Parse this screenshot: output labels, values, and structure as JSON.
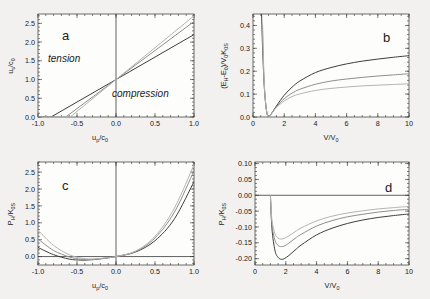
{
  "figure": {
    "background_color": "#f2f1ef",
    "frame_color": "#4a4a4a",
    "panel_fill": "#fdfdfc"
  },
  "curve_colors": [
    "#3d3d3d",
    "#8e8e8e",
    "#b4b4b4"
  ],
  "panels": {
    "a": {
      "letter": "a",
      "xlabel_main": "u",
      "xlabel_sub1": "p",
      "xlabel_mid": "/c",
      "xlabel_sub2": "0",
      "ylabel_main": "u",
      "ylabel_sub1": "s",
      "ylabel_mid": "/c",
      "ylabel_sub2": "0",
      "region_tension": "tension",
      "region_compression": "compression",
      "xticks": [
        "-1.0",
        "-0.5",
        "0.0",
        "0.5",
        "1.0"
      ],
      "yticks": [
        "0.0",
        "0.5",
        "1.0",
        "1.5",
        "2.0",
        "2.5"
      ]
    },
    "b": {
      "letter": "b",
      "xlabel_main": "V/V",
      "xlabel_sub": "0",
      "ylabel_p1": "(E",
      "ylabel_s1": "H",
      "ylabel_p2": "-E",
      "ylabel_s2": "0",
      "ylabel_p3": ")/V",
      "ylabel_s3": "0",
      "ylabel_p4": "K",
      "ylabel_s4": "0S",
      "xticks": [
        "0",
        "2",
        "4",
        "6",
        "8",
        "10"
      ],
      "yticks": [
        "0.0",
        "0.1",
        "0.2",
        "0.3",
        "0.4"
      ]
    },
    "c": {
      "letter": "c",
      "xlabel_main": "u",
      "xlabel_sub1": "p",
      "xlabel_mid": "/c",
      "xlabel_sub2": "0",
      "ylabel_p1": "P",
      "ylabel_s1": "H",
      "ylabel_p2": "/K",
      "ylabel_s2": "0S",
      "xticks": [
        "-1.0",
        "-0.5",
        "0.0",
        "0.5",
        "1.0"
      ],
      "yticks": [
        "0.0",
        "0.5",
        "1.0",
        "1.5",
        "2.0",
        "2.5"
      ]
    },
    "d": {
      "letter": "d",
      "xlabel_main": "V/V",
      "xlabel_sub": "0",
      "ylabel_p1": "P",
      "ylabel_s1": "H",
      "ylabel_p2": "/K",
      "ylabel_s2": "0S",
      "xticks": [
        "0",
        "2",
        "4",
        "6",
        "8",
        "10"
      ],
      "yticks": [
        "0.10",
        "0.05",
        "0.00",
        "-0.05",
        "-0.10",
        "-0.15",
        "-0.20"
      ]
    }
  },
  "chart_data": [
    {
      "id": "a",
      "type": "line",
      "title": "a",
      "xlabel": "u_p/c_0",
      "ylabel": "u_s/c_0",
      "xlim": [
        -1.0,
        1.0
      ],
      "ylim": [
        0.0,
        2.75
      ],
      "grid": false,
      "legend": "none",
      "annotations": [
        "tension",
        "compression"
      ],
      "note": "Shock velocity vs particle velocity; three linear Hugoniots u_s/c_0 = 1 + S*(u_p/c_0) with differing slopes S, all passing through (0,1).",
      "series": [
        {
          "name": "S = 1.20",
          "x": [
            -1.0,
            -0.8333,
            -0.5,
            0.0,
            0.5,
            1.0
          ],
          "y": [
            0.0,
            0.0,
            0.4,
            1.0,
            1.6,
            2.2
          ]
        },
        {
          "name": "S = 1.55",
          "x": [
            -1.0,
            -0.645,
            -0.5,
            0.0,
            0.5,
            1.0
          ],
          "y": [
            0.0,
            0.0,
            0.225,
            1.0,
            1.775,
            2.55
          ]
        },
        {
          "name": "S = 1.70",
          "x": [
            -1.0,
            -0.588,
            -0.5,
            0.0,
            0.5,
            1.0
          ],
          "y": [
            0.0,
            0.0,
            0.15,
            1.0,
            1.85,
            2.7
          ]
        }
      ]
    },
    {
      "id": "b",
      "type": "line",
      "title": "b",
      "xlabel": "V/V_0",
      "ylabel": "(E_H-E_0)/V_0K_0S",
      "xlim": [
        0,
        10
      ],
      "ylim": [
        0.0,
        0.45
      ],
      "grid": false,
      "legend": "none",
      "note": "Hugoniot energy rises steeply for V/V_0 < 1, passes through zero at V/V_0 = 1, then increases monotonically toward a plateau.",
      "series": [
        {
          "name": "S = 1.20",
          "x": [
            0.55,
            0.6,
            0.7,
            0.8,
            0.9,
            1.0,
            1.2,
            1.5,
            2.0,
            2.5,
            3.0,
            4.0,
            5.0,
            6.0,
            7.0,
            8.0,
            9.0,
            10.0
          ],
          "y": [
            0.45,
            0.33,
            0.16,
            0.065,
            0.015,
            0.0,
            0.017,
            0.048,
            0.095,
            0.13,
            0.157,
            0.194,
            0.216,
            0.232,
            0.244,
            0.253,
            0.261,
            0.268
          ]
        },
        {
          "name": "S = 1.55",
          "x": [
            0.6,
            0.7,
            0.8,
            0.9,
            1.0,
            1.2,
            1.5,
            2.0,
            2.5,
            3.0,
            4.0,
            5.0,
            6.0,
            7.0,
            8.0,
            9.0,
            10.0
          ],
          "y": [
            0.4,
            0.175,
            0.068,
            0.016,
            0.0,
            0.016,
            0.044,
            0.08,
            0.104,
            0.121,
            0.143,
            0.157,
            0.166,
            0.173,
            0.179,
            0.184,
            0.189
          ]
        },
        {
          "name": "S = 1.70",
          "x": [
            0.62,
            0.7,
            0.8,
            0.9,
            1.0,
            1.2,
            1.5,
            2.0,
            2.5,
            3.0,
            4.0,
            5.0,
            6.0,
            7.0,
            8.0,
            9.0,
            10.0
          ],
          "y": [
            0.4,
            0.185,
            0.07,
            0.016,
            0.0,
            0.015,
            0.041,
            0.07,
            0.089,
            0.101,
            0.116,
            0.125,
            0.131,
            0.136,
            0.139,
            0.142,
            0.145
          ]
        }
      ]
    },
    {
      "id": "c",
      "type": "line",
      "title": "c",
      "xlabel": "u_p/c_0",
      "ylabel": "P_H/K_0S",
      "xlim": [
        -1.0,
        1.0
      ],
      "ylim": [
        -0.25,
        2.8
      ],
      "grid": false,
      "legend": "none",
      "note": "Hugoniot pressure vs particle velocity; parabolic, zero at u_p=0, shallow negative minimum near u_p/c_0 = -0.35 to -0.45, rising steeply in compression.",
      "series": [
        {
          "name": "S = 1.20",
          "x": [
            -1.0,
            -0.8,
            -0.6,
            -0.45,
            -0.35,
            -0.25,
            -0.1,
            0.0,
            0.25,
            0.5,
            0.75,
            1.0
          ],
          "y": [
            0.27,
            0.055,
            -0.075,
            -0.105,
            -0.1,
            -0.082,
            -0.037,
            0.0,
            0.135,
            0.47,
            1.12,
            2.22
          ]
        },
        {
          "name": "S = 1.55",
          "x": [
            -1.0,
            -0.8,
            -0.6,
            -0.45,
            -0.35,
            -0.25,
            -0.1,
            0.0,
            0.25,
            0.5,
            0.75,
            1.0
          ],
          "y": [
            0.52,
            0.18,
            -0.01,
            -0.08,
            -0.09,
            -0.075,
            -0.035,
            0.0,
            0.15,
            0.55,
            1.32,
            2.54
          ]
        },
        {
          "name": "S = 1.70",
          "x": [
            -1.0,
            -0.8,
            -0.6,
            -0.45,
            -0.35,
            -0.25,
            -0.1,
            0.0,
            0.25,
            0.5,
            0.75,
            1.0
          ],
          "y": [
            0.78,
            0.33,
            0.055,
            -0.045,
            -0.07,
            -0.065,
            -0.032,
            0.0,
            0.16,
            0.6,
            1.44,
            2.72
          ]
        }
      ]
    },
    {
      "id": "d",
      "type": "line",
      "title": "d",
      "xlabel": "V/V_0",
      "ylabel": "P_H/K_0S",
      "xlim": [
        0,
        10
      ],
      "ylim": [
        -0.22,
        0.105
      ],
      "grid": false,
      "legend": "none",
      "note": "Hugoniot pressure in expansion; spikes positive just below V/V_0 = 1, crosses zero at V/V_0 = 1, dips to a negative minimum near V/V_0 = 1.7-2.0, then rises asymptotically toward zero.",
      "series": [
        {
          "name": "S = 1.20",
          "x": [
            1.0,
            1.1,
            1.3,
            1.5,
            1.7,
            1.9,
            2.2,
            2.6,
            3.0,
            4.0,
            5.0,
            6.0,
            7.0,
            8.0,
            9.0,
            10.0
          ],
          "y": [
            0.0,
            -0.105,
            -0.175,
            -0.196,
            -0.202,
            -0.2,
            -0.19,
            -0.173,
            -0.157,
            -0.125,
            -0.104,
            -0.089,
            -0.078,
            -0.07,
            -0.064,
            -0.059
          ]
        },
        {
          "name": "S = 1.55",
          "x": [
            1.0,
            1.1,
            1.3,
            1.5,
            1.7,
            1.9,
            2.2,
            2.6,
            3.0,
            4.0,
            5.0,
            6.0,
            7.0,
            8.0,
            9.0,
            10.0
          ],
          "y": [
            0.0,
            -0.092,
            -0.143,
            -0.158,
            -0.162,
            -0.16,
            -0.151,
            -0.136,
            -0.123,
            -0.097,
            -0.08,
            -0.068,
            -0.06,
            -0.053,
            -0.048,
            -0.044
          ]
        },
        {
          "name": "S = 1.70",
          "x": [
            1.0,
            1.1,
            1.3,
            1.5,
            1.7,
            1.9,
            2.2,
            2.6,
            3.0,
            4.0,
            5.0,
            6.0,
            7.0,
            8.0,
            9.0,
            10.0
          ],
          "y": [
            0.0,
            -0.078,
            -0.122,
            -0.135,
            -0.138,
            -0.136,
            -0.128,
            -0.115,
            -0.103,
            -0.081,
            -0.066,
            -0.056,
            -0.049,
            -0.043,
            -0.039,
            -0.035
          ]
        }
      ]
    }
  ]
}
